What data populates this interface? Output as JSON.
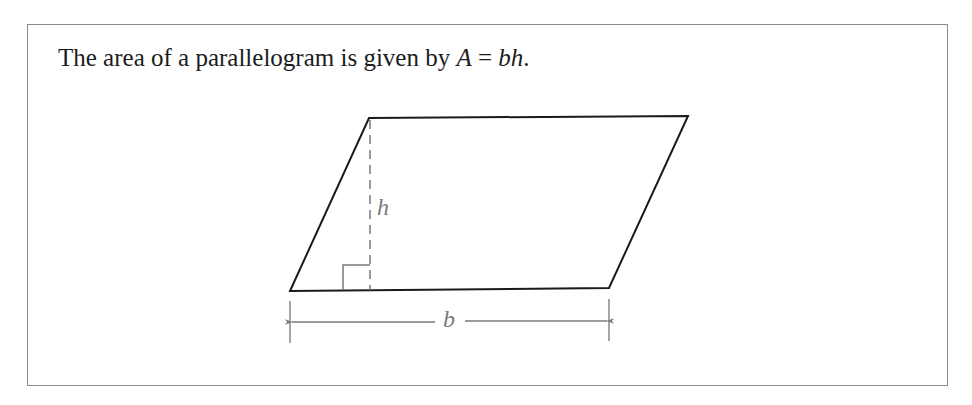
{
  "statement": {
    "prefix": "The area of a parallelogram is given by ",
    "formula_lhs": "A",
    "formula_eq": " = ",
    "formula_rhs": "bh",
    "suffix": "."
  },
  "figure": {
    "shape": "parallelogram",
    "height_label": "h",
    "base_label": "b",
    "colors": {
      "outline": "#1a1a1a",
      "annotation": "#7a7a7a",
      "frame": "#8a8a8a"
    }
  }
}
